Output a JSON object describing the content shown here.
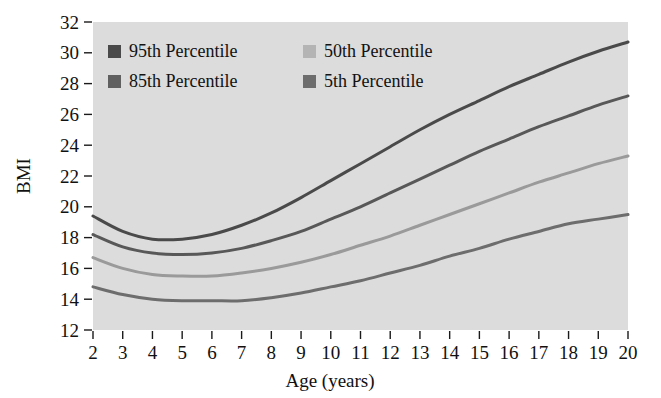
{
  "chart_data": {
    "type": "line",
    "title": "",
    "xlabel": "Age (years)",
    "ylabel": "BMI",
    "xlim": [
      2,
      20
    ],
    "ylim": [
      12,
      32
    ],
    "x_ticks": [
      2,
      3,
      4,
      5,
      6,
      7,
      8,
      9,
      10,
      11,
      12,
      13,
      14,
      15,
      16,
      17,
      18,
      19,
      20
    ],
    "y_ticks": [
      12,
      14,
      16,
      18,
      20,
      22,
      24,
      26,
      28,
      30,
      32
    ],
    "grid": false,
    "legend_position": "top-left-inside",
    "plot_background": "#dcdcdc",
    "x": [
      2,
      3,
      4,
      5,
      6,
      7,
      8,
      9,
      10,
      11,
      12,
      13,
      14,
      15,
      16,
      17,
      18,
      19,
      20
    ],
    "series": [
      {
        "name": "95th Percentile",
        "color": "#4a4a4a",
        "values": [
          19.4,
          18.4,
          17.9,
          17.9,
          18.2,
          18.8,
          19.6,
          20.6,
          21.7,
          22.8,
          23.9,
          25.0,
          26.0,
          26.9,
          27.8,
          28.6,
          29.4,
          30.1,
          30.7
        ]
      },
      {
        "name": "85th Percentile",
        "color": "#585858",
        "values": [
          18.2,
          17.4,
          17.0,
          16.9,
          17.0,
          17.3,
          17.8,
          18.4,
          19.2,
          20.0,
          20.9,
          21.8,
          22.7,
          23.6,
          24.4,
          25.2,
          25.9,
          26.6,
          27.2
        ]
      },
      {
        "name": "50th Percentile",
        "color": "#9a9a9a",
        "values": [
          16.7,
          16.0,
          15.6,
          15.5,
          15.5,
          15.7,
          16.0,
          16.4,
          16.9,
          17.5,
          18.1,
          18.8,
          19.5,
          20.2,
          20.9,
          21.6,
          22.2,
          22.8,
          23.3
        ]
      },
      {
        "name": "5th Percentile",
        "color": "#6d6d6d",
        "values": [
          14.8,
          14.3,
          14.0,
          13.9,
          13.9,
          13.9,
          14.1,
          14.4,
          14.8,
          15.2,
          15.7,
          16.2,
          16.8,
          17.3,
          17.9,
          18.4,
          18.9,
          19.2,
          19.5
        ]
      }
    ]
  },
  "legend": {
    "entries": [
      {
        "label": "95th Percentile",
        "color": "#4a4a4a"
      },
      {
        "label": "50th Percentile",
        "color": "#b4b4b4"
      },
      {
        "label": "85th Percentile",
        "color": "#606060"
      },
      {
        "label": "5th Percentile",
        "color": "#6d6d6d"
      }
    ]
  }
}
